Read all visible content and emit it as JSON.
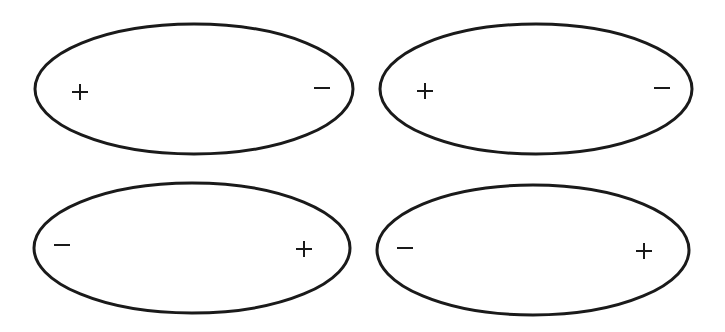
{
  "diagram": {
    "stroke_color": "#1a1a1a",
    "background_color": "#ffffff",
    "ellipses": [
      {
        "id": "top-left",
        "center": [
          194,
          89
        ],
        "rx": 159,
        "ry": 65,
        "left_sign": "+",
        "right_sign": "−",
        "left_sign_pos": [
          80,
          92
        ],
        "right_sign_pos": [
          322,
          88
        ]
      },
      {
        "id": "top-right",
        "center": [
          536,
          89
        ],
        "rx": 156,
        "ry": 65,
        "left_sign": "+",
        "right_sign": "−",
        "left_sign_pos": [
          425,
          91
        ],
        "right_sign_pos": [
          662,
          88
        ]
      },
      {
        "id": "bottom-left",
        "center": [
          192,
          248
        ],
        "rx": 158,
        "ry": 65,
        "left_sign": "−",
        "right_sign": "+",
        "left_sign_pos": [
          62,
          245
        ],
        "right_sign_pos": [
          304,
          249
        ]
      },
      {
        "id": "bottom-right",
        "center": [
          533,
          250
        ],
        "rx": 156,
        "ry": 65,
        "left_sign": "−",
        "right_sign": "+",
        "left_sign_pos": [
          405,
          248
        ],
        "right_sign_pos": [
          644,
          251
        ]
      }
    ]
  }
}
